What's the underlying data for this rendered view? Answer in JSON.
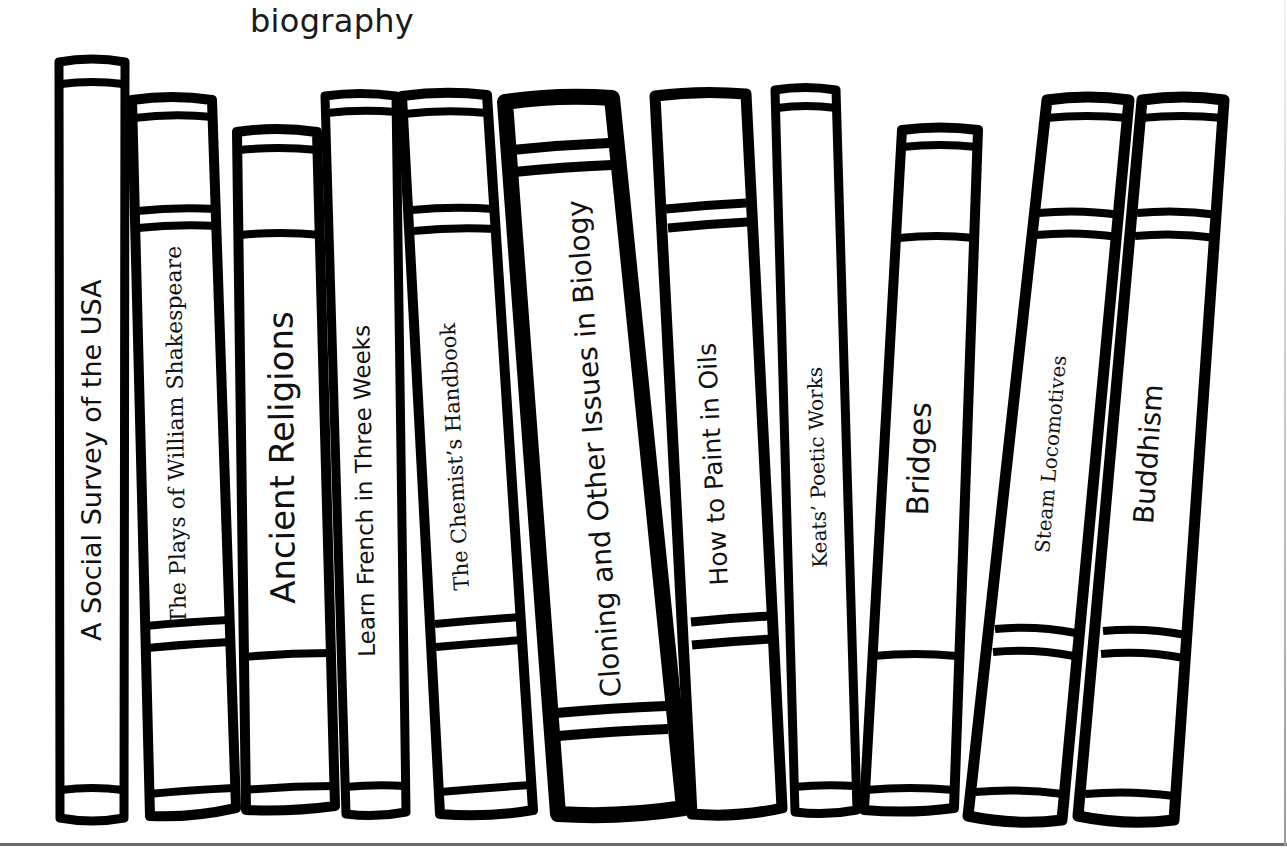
{
  "heading": "biography",
  "colors": {
    "ink": "#000000",
    "background": "#ffffff",
    "shelf_line": "#6b6b6b"
  },
  "books": [
    {
      "title": "A Social Survey of the USA",
      "font": "sans"
    },
    {
      "title": "The Plays of William Shakespeare",
      "font": "serif"
    },
    {
      "title": "Ancient Religions",
      "font": "sans"
    },
    {
      "title": "Learn French in Three Weeks",
      "font": "sans"
    },
    {
      "title": "The Chemist’s Handbook",
      "font": "serif"
    },
    {
      "title": "Cloning and Other Issues in Biology",
      "font": "sans"
    },
    {
      "title": "How to Paint in Oils",
      "font": "sans"
    },
    {
      "title": "Keats’ Poetic Works",
      "font": "serif"
    },
    {
      "title": "Bridges",
      "font": "sans"
    },
    {
      "title": "Steam Locomotives",
      "font": "serif"
    },
    {
      "title": "Buddhism",
      "font": "sans"
    }
  ]
}
